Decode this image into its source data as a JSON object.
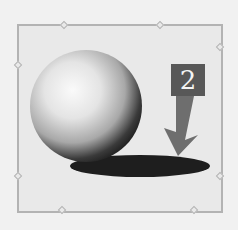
{
  "figure": {
    "label_number": "2",
    "colors": {
      "background": "#f1f1f1",
      "frame_fill": "#e9e9e9",
      "frame_border": "#b3b3b3",
      "label_box": "#585858",
      "arrow": "#6e6e6e",
      "shadow": "#1e1e1e"
    }
  }
}
